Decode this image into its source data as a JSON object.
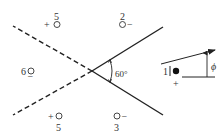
{
  "diagram": {
    "type": "method-of-images",
    "wedge_angle_label": "60°",
    "angle_label": "ϕ",
    "colors": {
      "line": "#222222",
      "text": "#333333",
      "background": "#ffffff"
    },
    "real_charge": {
      "index": "1",
      "sign": "+",
      "marker": "filled-circle"
    },
    "image_charges": [
      {
        "index": "2",
        "sign": "−",
        "marker": "open-circle",
        "position": "upper-right"
      },
      {
        "index": "3",
        "sign": "−",
        "marker": "open-circle",
        "position": "lower-right"
      },
      {
        "index": "4",
        "sign": "+",
        "marker": "open-circle",
        "position": "upper-left"
      },
      {
        "index": "5",
        "sign": "+",
        "marker": "open-circle",
        "position": "lower-left"
      },
      {
        "index": "6",
        "sign": "−",
        "marker": "open-circle",
        "position": "left"
      }
    ],
    "lines": {
      "conductor_planes": "solid",
      "extensions": "dashed",
      "reference_axis": "solid-horizontal",
      "direction_arrow": "arrow"
    }
  }
}
